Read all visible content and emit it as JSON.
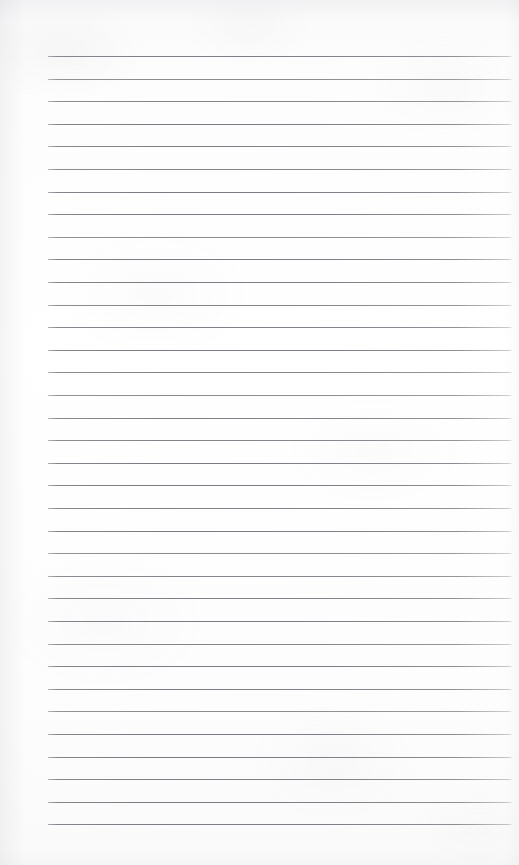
{
  "page": {
    "kind": "blank-lined-notebook-page",
    "width": 519,
    "height": 865,
    "paper_color": "#fdfdfd",
    "content_text": ""
  },
  "ruling": {
    "line_color": "#7c7f85",
    "line_thickness": 1,
    "line_count": 35,
    "line_left_x": 48,
    "line_right_x": 512,
    "first_line_y": 56,
    "last_line_y": 824,
    "line_spacing": 22.6,
    "lines_y": [
      56,
      78.6,
      101.2,
      123.8,
      146.4,
      169,
      191.6,
      214.2,
      236.8,
      259.4,
      282,
      304.6,
      327.2,
      349.8,
      372.4,
      395,
      417.6,
      440.2,
      462.8,
      485.4,
      508,
      530.6,
      553.2,
      575.8,
      598.4,
      621,
      643.6,
      666.2,
      688.8,
      711.4,
      734,
      756.6,
      779.2,
      801.8,
      824.4
    ]
  },
  "margins": {
    "left_margin_width": 48,
    "right_margin_width": 7,
    "top_margin_height": 56,
    "bottom_margin_height": 41
  }
}
